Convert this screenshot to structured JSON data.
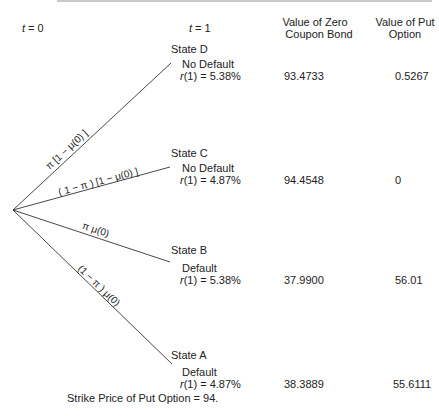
{
  "header": {
    "faded_text": "   "
  },
  "columns": {
    "t0": "t = 0",
    "t1": "t = 1",
    "bond_line1": "Value of Zero",
    "bond_line2": "Coupon Bond",
    "put_line1": "Value of Put",
    "put_line2": "Option"
  },
  "branches": [
    {
      "id": "D",
      "label": "π [1 − μ(0) ]"
    },
    {
      "id": "C",
      "label": "( 1 − π ) [1 − μ(0) ]"
    },
    {
      "id": "B",
      "label": "π μ(0)"
    },
    {
      "id": "A",
      "label": "(1 − π ) μ(0)"
    }
  ],
  "states": [
    {
      "name": "State D",
      "status": "No Default",
      "r_prefix": "r",
      "r_text": "(1) = 5.38%",
      "bond": "93.4733",
      "put": "0.5267"
    },
    {
      "name": "State C",
      "status": "No Default",
      "r_prefix": "r",
      "r_text": "(1) = 4.87%",
      "bond": "94.4548",
      "put": "0"
    },
    {
      "name": "State B",
      "status": "Default",
      "r_prefix": "r",
      "r_text": "(1) = 5.38%",
      "bond": "37.9900",
      "put": "56.01"
    },
    {
      "name": "State A",
      "status": "Default",
      "r_prefix": "r",
      "r_text": "(1) = 4.87%",
      "bond": "38.3889",
      "put": "55.6111"
    }
  ],
  "footer": {
    "strike_note": "Strike Price of Put Option = 94."
  },
  "colors": {
    "line": "#333333",
    "text": "#222222",
    "rule": "#c9c9c9"
  }
}
